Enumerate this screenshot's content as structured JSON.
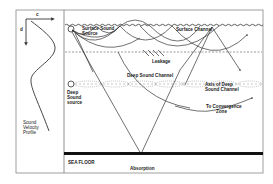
{
  "diagram": {
    "profile_panel": {
      "x_axis_label": "c",
      "y_axis_label": "d",
      "caption_lines": [
        "Sound",
        "Velocity",
        "Profile"
      ]
    },
    "labels": {
      "surface_source_line1": "Surface Sound",
      "surface_source_line2": "Source",
      "surface_channel": "Surface Channel",
      "leakage": "Leakage",
      "deep_sound_channel": "Deep Sound Channel",
      "axis_line1": "Axis of Deep",
      "axis_line2": "Sound Channel",
      "deep_source_line1": "Deep",
      "deep_source_line2": "Sound",
      "deep_source_line3": "source",
      "convergence_line1": "To Convergence",
      "convergence_line2": "Zone",
      "sea_floor": "SEA FLOOR",
      "absorption": "Absorption"
    },
    "colors": {
      "line": "#333333",
      "frame": "#888888",
      "sea_floor": "#111111",
      "dotted": "#999999"
    }
  }
}
